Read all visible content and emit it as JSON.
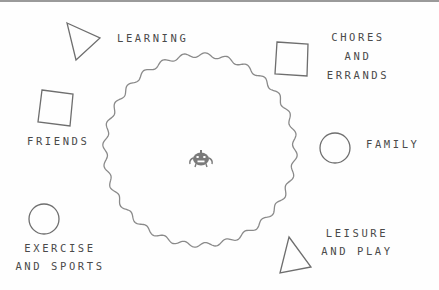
{
  "diagram": {
    "center": {
      "icon": "pumpkin-icon",
      "shape": "wavy-circle"
    },
    "categories": [
      {
        "id": "learning",
        "shape": "triangle",
        "lines": [
          "LEARNING"
        ]
      },
      {
        "id": "chores",
        "shape": "square",
        "lines": [
          "CHORES",
          "AND",
          "ERRANDS"
        ]
      },
      {
        "id": "friends",
        "shape": "square",
        "lines": [
          "FRIENDS"
        ]
      },
      {
        "id": "family",
        "shape": "circle",
        "lines": [
          "FAMILY"
        ]
      },
      {
        "id": "exercise",
        "shape": "circle",
        "lines": [
          "EXERCISE",
          "AND SPORTS"
        ]
      },
      {
        "id": "leisure",
        "shape": "triangle",
        "lines": [
          "LEISURE",
          "AND PLAY"
        ]
      }
    ]
  },
  "colors": {
    "stroke": "#6e6e6e",
    "text": "#4a4a4a",
    "icon": "#7a7a7a",
    "border": "#9a9a9a",
    "background": "#fefefe"
  }
}
